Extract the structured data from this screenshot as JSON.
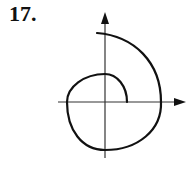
{
  "problem": {
    "number_label": "17."
  },
  "figure": {
    "type": "polar spiral curve on Cartesian axes",
    "axes": {
      "origin_px": [
        105,
        102
      ],
      "x_axis": {
        "from_px": [
          58,
          102
        ],
        "to_px": [
          186,
          102
        ],
        "arrow": true
      },
      "y_axis": {
        "from_px": [
          105,
          158
        ],
        "to_px": [
          105,
          12
        ],
        "arrow": true
      }
    },
    "curve": {
      "description": "Spiral starting on positive x-axis near origin, winding counterclockwise through top, left, bottom, crossing positive x-axis farther out, ending near the top of the positive y-axis",
      "stroke_color": "#111111"
    },
    "colors": {
      "axis": "#333333",
      "curve": "#111111",
      "background": "#ffffff"
    }
  }
}
